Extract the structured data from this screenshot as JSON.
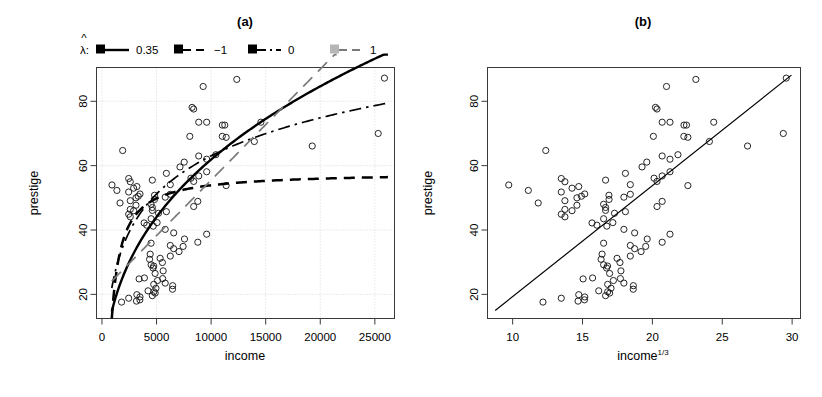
{
  "figure": {
    "width": 822,
    "height": 397,
    "background": "#ffffff"
  },
  "panel_a": {
    "title": "(a)",
    "legend": {
      "symbol": "λ",
      "hat": "^",
      "colon": ":",
      "entries": [
        {
          "label": "0.35",
          "style": "solid",
          "color": "#000000"
        },
        {
          "label": "−1",
          "style": "dashed",
          "color": "#000000"
        },
        {
          "label": "0",
          "style": "dashdot",
          "color": "#000000"
        },
        {
          "label": "1",
          "style": "longdash",
          "color": "#7a7a7a"
        }
      ]
    },
    "xlabel": "income",
    "ylabel": "prestige",
    "xticks": [
      "0",
      "5000",
      "10000",
      "15000",
      "20000",
      "25000"
    ],
    "yticks": [
      "20",
      "40",
      "60",
      "80"
    ]
  },
  "panel_b": {
    "title": "(b)",
    "xlabel_base": "income",
    "xlabel_exp": "1/3",
    "ylabel": "prestige",
    "xticks": [
      "10",
      "15",
      "20",
      "25",
      "30"
    ],
    "yticks": [
      "20",
      "40",
      "60",
      "80"
    ]
  },
  "chart_data": [
    {
      "type": "scatter",
      "panel": "(a)",
      "title": "(a)",
      "xlabel": "income",
      "ylabel": "prestige",
      "xlim": [
        -500,
        26800
      ],
      "ylim": [
        12.5,
        90.5
      ],
      "xticks": [
        0,
        5000,
        10000,
        15000,
        20000,
        25000
      ],
      "yticks": [
        20,
        40,
        60,
        80
      ],
      "grid": true,
      "grid_style": "dotted-light",
      "marker": "open-circle",
      "legend_title": "lambda-hat:",
      "legend_position": "above-plot",
      "x": [
        12351,
        25879,
        9271,
        8865,
        8403,
        11030,
        8258,
        14558,
        11377,
        11023,
        19263,
        9593,
        25308,
        1899,
        13959,
        8049,
        11253,
        9593,
        10432,
        9593,
        7534,
        8865,
        7147,
        8865,
        5902,
        8403,
        11377,
        8150,
        6259,
        6259,
        4816,
        5795,
        8780,
        8403,
        4614,
        5052,
        4105,
        4696,
        5795,
        6573,
        9593,
        7562,
        8780,
        4500,
        6259,
        7436,
        6565,
        7059,
        4418,
        6259,
        5332,
        4364,
        5536,
        4504,
        4741,
        4681,
        5606,
        4869,
        3886,
        5562,
        3403,
        5092,
        5795,
        4742,
        6477,
        4944,
        6462,
        4224,
        4753,
        4876,
        3198,
        4614,
        3485,
        2448,
        3472,
        3161,
        1795,
        3861,
        4504,
        2594,
        2448,
        5180,
        5902,
        2901,
        2594,
        4614,
        3116,
        4500,
        1656,
        2594,
        4817,
        3116,
        3322,
        3485,
        2448,
        1368,
        2901,
        3198,
        918,
        2594,
        4613,
        2448
      ],
      "y": [
        86.8,
        87.2,
        84.6,
        73.5,
        77.6,
        72.6,
        78.1,
        73.5,
        68.8,
        69.1,
        66.1,
        73.5,
        70.0,
        64.7,
        67.5,
        69.1,
        72.6,
        58.1,
        63.4,
        62.0,
        61.1,
        63.0,
        59.6,
        56.8,
        57.6,
        55.1,
        53.8,
        56.1,
        54.1,
        51.1,
        50.8,
        50.2,
        48.9,
        47.3,
        46.1,
        42.3,
        41.5,
        41.2,
        40.2,
        39.1,
        38.7,
        37.2,
        36.2,
        35.9,
        35.2,
        34.9,
        34.2,
        33.3,
        32.5,
        31.9,
        31.2,
        30.9,
        29.9,
        29.2,
        28.8,
        28.2,
        27.3,
        26.5,
        25.1,
        24.9,
        24.8,
        24.3,
        23.5,
        23.1,
        22.7,
        21.9,
        21.6,
        21.1,
        20.8,
        20.4,
        19.9,
        19.6,
        19.2,
        18.8,
        18.3,
        17.9,
        17.6,
        42.2,
        43.5,
        44.1,
        44.9,
        45.2,
        45.7,
        46.0,
        46.4,
        47.0,
        47.7,
        48.0,
        48.4,
        49.1,
        49.5,
        50.0,
        50.5,
        51.2,
        51.8,
        52.3,
        53.0,
        53.5,
        54.0,
        55.0,
        55.5,
        56.0
      ],
      "series": [
        {
          "name": "lambda-hat = 0.35",
          "style": "solid",
          "color": "#000000",
          "lw": 2.2,
          "description": "fitted power-transform curve, concave increasing from ~15 at income 900 to ~88 at income 25900"
        },
        {
          "name": "lambda-hat = -1",
          "style": "dashed",
          "color": "#000000",
          "lw": 2.2,
          "description": "inverse transform curve, rises sharply then flattens at ~55"
        },
        {
          "name": "lambda-hat = 0",
          "style": "dashdot",
          "color": "#000000",
          "lw": 1.6,
          "description": "log transform curve, concave increasing to ~79 at income 25900"
        },
        {
          "name": "lambda-hat = 1",
          "style": "longdash",
          "color": "#7a7a7a",
          "lw": 1.6,
          "description": "identity/linear fit, straight line from ~25 at income 900 to ~95 at income 21000"
        }
      ]
    },
    {
      "type": "scatter",
      "panel": "(b)",
      "title": "(b)",
      "xlabel": "income^(1/3)",
      "ylabel": "prestige",
      "xlim": [
        8.2,
        30.6
      ],
      "ylim": [
        12.5,
        90.5
      ],
      "xticks": [
        10,
        15,
        20,
        25,
        30
      ],
      "yticks": [
        20,
        40,
        60,
        80
      ],
      "grid": false,
      "marker": "open-circle",
      "x": [
        23.11,
        29.58,
        21.01,
        20.7,
        20.33,
        22.26,
        20.22,
        24.39,
        22.54,
        22.25,
        26.81,
        21.26,
        29.37,
        12.37,
        24.08,
        20.07,
        22.44,
        21.26,
        21.83,
        21.26,
        19.6,
        20.7,
        19.26,
        20.7,
        18.07,
        20.33,
        22.54,
        20.12,
        18.42,
        18.42,
        16.89,
        17.96,
        20.7,
        20.33,
        16.65,
        17.17,
        16.03,
        16.74,
        17.96,
        18.73,
        21.26,
        19.63,
        20.7,
        16.51,
        18.42,
        19.52,
        18.73,
        19.19,
        16.4,
        18.42,
        17.47,
        16.33,
        17.68,
        16.51,
        16.79,
        16.72,
        17.75,
        16.94,
        15.72,
        17.71,
        15.04,
        17.21,
        17.96,
        16.8,
        18.64,
        17.04,
        18.63,
        16.16,
        16.8,
        16.94,
        14.73,
        16.65,
        15.16,
        13.48,
        15.14,
        14.68,
        12.17,
        15.68,
        16.51,
        13.74,
        13.48,
        17.29,
        18.07,
        14.25,
        13.74,
        16.65,
        14.6,
        16.51,
        11.83,
        13.74,
        16.9,
        14.6,
        14.92,
        15.16,
        13.48,
        11.12,
        14.25,
        14.73,
        9.72,
        13.74,
        16.65,
        13.48
      ],
      "y": [
        86.8,
        87.2,
        84.6,
        73.5,
        77.6,
        72.6,
        78.1,
        73.5,
        68.8,
        69.1,
        66.1,
        73.5,
        70.0,
        64.7,
        67.5,
        69.1,
        72.6,
        58.1,
        63.4,
        62.0,
        61.1,
        63.0,
        59.6,
        56.8,
        57.6,
        55.1,
        53.8,
        56.1,
        54.1,
        51.1,
        50.8,
        50.2,
        48.9,
        47.3,
        46.1,
        42.3,
        41.5,
        41.2,
        40.2,
        39.1,
        38.7,
        37.2,
        36.2,
        35.9,
        35.2,
        34.9,
        34.2,
        33.3,
        32.5,
        31.9,
        31.2,
        30.9,
        29.9,
        29.2,
        28.8,
        28.2,
        27.3,
        26.5,
        25.1,
        24.9,
        24.8,
        24.3,
        23.5,
        23.1,
        22.7,
        21.9,
        21.6,
        21.1,
        20.8,
        20.4,
        19.9,
        19.6,
        19.2,
        18.8,
        18.3,
        17.9,
        17.6,
        42.2,
        43.5,
        44.1,
        44.9,
        45.2,
        45.7,
        46.0,
        46.4,
        47.0,
        47.7,
        48.0,
        48.4,
        49.1,
        49.5,
        50.0,
        50.5,
        51.2,
        51.8,
        52.3,
        53.0,
        53.5,
        54.0,
        55.0,
        55.5,
        56.0
      ],
      "series": [
        {
          "name": "linear fit",
          "style": "solid",
          "color": "#000000",
          "lw": 1.2,
          "description": "straight regression line from (8.8, 15) to (29.9, 88)"
        }
      ]
    }
  ]
}
